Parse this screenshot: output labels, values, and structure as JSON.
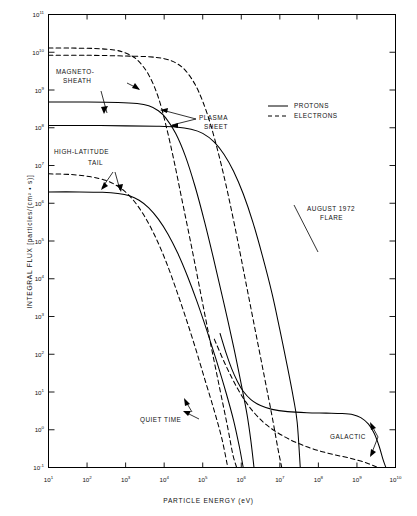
{
  "chart_data": {
    "type": "line",
    "title": "",
    "xlabel": "PARTICLE ENERGY (eV)",
    "ylabel": "INTEGRAL FLUX [particles/(cm² • s)]",
    "xlim": [
      1,
      10
    ],
    "ylim": [
      -1,
      11
    ],
    "xscale": "log",
    "yscale": "log",
    "grid": false,
    "legend_position": "top-right",
    "x_ticks": [
      "10¹",
      "10²",
      "10³",
      "10⁴",
      "10⁵",
      "10⁶",
      "10⁷",
      "10⁸",
      "10⁹",
      "10¹⁰"
    ],
    "x_tick_exponents": [
      1,
      2,
      3,
      4,
      5,
      6,
      7,
      8,
      9,
      10
    ],
    "y_ticks": [
      "10⁻¹",
      "10⁰",
      "10¹",
      "10²",
      "10³",
      "10⁴",
      "10⁵",
      "10⁶",
      "10⁷",
      "10⁸",
      "10⁹",
      "10¹⁰",
      "10¹¹"
    ],
    "y_tick_exponents": [
      -1,
      0,
      1,
      2,
      3,
      4,
      5,
      6,
      7,
      8,
      9,
      10,
      11
    ],
    "legend": [
      {
        "label": "PROTONS",
        "style": "solid"
      },
      {
        "label": "ELECTRONS",
        "style": "dashed"
      }
    ],
    "annotations": [
      {
        "text": "MAGNETO-\nSHEATH",
        "lines": [
          "MAGNETO-",
          "SHEATH"
        ]
      },
      {
        "text": "PLASMA\nSHEET",
        "lines": [
          "PLASMA",
          "SHEET"
        ]
      },
      {
        "text": "HIGH-LATITUDE\nTAIL",
        "lines": [
          "HIGH-LATITUDE",
          "TAIL"
        ]
      },
      {
        "text": "AUGUST 1972\nFLARE",
        "lines": [
          "AUGUST 1972",
          "FLARE"
        ]
      },
      {
        "text": "QUIET TIME",
        "lines": [
          "QUIET TIME"
        ]
      },
      {
        "text": "GALACTIC",
        "lines": [
          "GALACTIC"
        ]
      }
    ],
    "series": [
      {
        "name": "MAGNETOSHEATH ELECTRONS",
        "style": "dashed",
        "particle": "electrons",
        "points": [
          [
            1,
            10.11
          ],
          [
            1.6,
            10.11
          ],
          [
            2.2,
            10.1
          ],
          [
            2.7,
            10.06
          ],
          [
            3.0,
            9.98
          ],
          [
            3.3,
            9.8
          ],
          [
            3.6,
            9.4
          ],
          [
            3.85,
            8.8
          ],
          [
            4.05,
            8.05
          ],
          [
            4.25,
            7.15
          ],
          [
            4.45,
            6.15
          ],
          [
            4.7,
            4.9
          ],
          [
            4.95,
            3.6
          ],
          [
            5.2,
            2.3
          ],
          [
            5.45,
            1.05
          ],
          [
            5.65,
            0.05
          ],
          [
            5.78,
            -0.65
          ],
          [
            5.88,
            -1.0
          ]
        ]
      },
      {
        "name": "MAGNETOSHEATH PROTONS",
        "style": "solid",
        "particle": "protons",
        "points": [
          [
            1,
            8.68
          ],
          [
            2,
            8.68
          ],
          [
            2.8,
            8.67
          ],
          [
            3.3,
            8.64
          ],
          [
            3.6,
            8.58
          ],
          [
            3.85,
            8.45
          ],
          [
            4.05,
            8.25
          ],
          [
            4.3,
            7.85
          ],
          [
            4.55,
            7.25
          ],
          [
            4.8,
            6.45
          ],
          [
            5.05,
            5.5
          ],
          [
            5.3,
            4.45
          ],
          [
            5.55,
            3.35
          ],
          [
            5.8,
            2.2
          ],
          [
            6.0,
            1.2
          ],
          [
            6.15,
            0.4
          ],
          [
            6.25,
            -0.3
          ],
          [
            6.33,
            -1.0
          ]
        ]
      },
      {
        "name": "PLASMA SHEET ELECTRONS",
        "style": "dashed",
        "particle": "electrons",
        "points": [
          [
            1,
            9.92
          ],
          [
            2,
            9.92
          ],
          [
            3,
            9.9
          ],
          [
            3.6,
            9.88
          ],
          [
            4.0,
            9.83
          ],
          [
            4.3,
            9.72
          ],
          [
            4.55,
            9.52
          ],
          [
            4.8,
            9.15
          ],
          [
            5.0,
            8.7
          ],
          [
            5.2,
            8.1
          ],
          [
            5.4,
            7.35
          ],
          [
            5.6,
            6.5
          ],
          [
            5.85,
            5.3
          ],
          [
            6.1,
            4.0
          ],
          [
            6.35,
            2.7
          ],
          [
            6.6,
            1.4
          ],
          [
            6.8,
            0.35
          ],
          [
            6.95,
            -0.5
          ],
          [
            7.05,
            -1.0
          ]
        ]
      },
      {
        "name": "PLASMA SHEET PROTONS",
        "style": "solid",
        "particle": "protons",
        "points": [
          [
            1,
            8.06
          ],
          [
            2,
            8.06
          ],
          [
            3,
            8.05
          ],
          [
            3.8,
            8.04
          ],
          [
            4.3,
            8.02
          ],
          [
            4.7,
            7.96
          ],
          [
            5.0,
            7.85
          ],
          [
            5.3,
            7.62
          ],
          [
            5.55,
            7.3
          ],
          [
            5.8,
            6.85
          ],
          [
            6.05,
            6.25
          ],
          [
            6.3,
            5.5
          ],
          [
            6.55,
            4.6
          ],
          [
            6.8,
            3.6
          ],
          [
            7.0,
            2.65
          ],
          [
            7.2,
            1.65
          ],
          [
            7.35,
            0.85
          ],
          [
            7.45,
            0.2
          ],
          [
            7.53,
            -1.0
          ]
        ]
      },
      {
        "name": "HIGH-LATITUDE TAIL ELECTRONS",
        "style": "dashed",
        "particle": "electrons",
        "points": [
          [
            1,
            6.78
          ],
          [
            1.6,
            6.76
          ],
          [
            2.1,
            6.7
          ],
          [
            2.5,
            6.6
          ],
          [
            2.8,
            6.45
          ],
          [
            3.05,
            6.25
          ],
          [
            3.3,
            5.95
          ],
          [
            3.55,
            5.55
          ],
          [
            3.8,
            5.05
          ],
          [
            4.05,
            4.45
          ],
          [
            4.3,
            3.75
          ],
          [
            4.55,
            3.0
          ],
          [
            4.8,
            2.2
          ],
          [
            5.05,
            1.35
          ],
          [
            5.3,
            0.5
          ],
          [
            5.5,
            -0.25
          ],
          [
            5.65,
            -1.0
          ]
        ]
      },
      {
        "name": "HIGH-LATITUDE TAIL PROTONS",
        "style": "solid",
        "particle": "protons",
        "points": [
          [
            1,
            6.3
          ],
          [
            1.8,
            6.3
          ],
          [
            2.4,
            6.29
          ],
          [
            2.8,
            6.26
          ],
          [
            3.1,
            6.2
          ],
          [
            3.35,
            6.08
          ],
          [
            3.6,
            5.88
          ],
          [
            3.85,
            5.58
          ],
          [
            4.1,
            5.18
          ],
          [
            4.35,
            4.68
          ],
          [
            4.6,
            4.08
          ],
          [
            4.85,
            3.4
          ],
          [
            5.1,
            2.65
          ],
          [
            5.35,
            1.85
          ],
          [
            5.6,
            1.0
          ],
          [
            5.8,
            0.25
          ],
          [
            5.95,
            -0.45
          ],
          [
            6.05,
            -1.0
          ]
        ]
      },
      {
        "name": "QUIET TIME / GALACTIC PROTONS",
        "style": "solid",
        "particle": "protons",
        "points": [
          [
            5.45,
            2.55
          ],
          [
            5.6,
            2.05
          ],
          [
            5.75,
            1.62
          ],
          [
            5.9,
            1.28
          ],
          [
            6.05,
            1.02
          ],
          [
            6.25,
            0.8
          ],
          [
            6.5,
            0.64
          ],
          [
            6.8,
            0.54
          ],
          [
            7.2,
            0.48
          ],
          [
            7.7,
            0.45
          ],
          [
            8.2,
            0.44
          ],
          [
            8.6,
            0.43
          ],
          [
            8.9,
            0.4
          ],
          [
            9.1,
            0.32
          ],
          [
            9.3,
            0.15
          ],
          [
            9.45,
            -0.1
          ],
          [
            9.58,
            -0.45
          ],
          [
            9.68,
            -0.8
          ],
          [
            9.75,
            -1.0
          ]
        ]
      },
      {
        "name": "QUIET TIME / GALACTIC ELECTRONS",
        "style": "dashed",
        "particle": "electrons",
        "points": [
          [
            5.3,
            2.4
          ],
          [
            5.6,
            1.7
          ],
          [
            5.9,
            1.1
          ],
          [
            6.2,
            0.62
          ],
          [
            6.55,
            0.22
          ],
          [
            6.9,
            -0.05
          ],
          [
            7.3,
            -0.28
          ],
          [
            7.7,
            -0.45
          ],
          [
            8.1,
            -0.58
          ],
          [
            8.5,
            -0.68
          ],
          [
            8.85,
            -0.76
          ],
          [
            9.1,
            -0.83
          ],
          [
            9.3,
            -0.9
          ],
          [
            9.45,
            -0.96
          ],
          [
            9.55,
            -1.0
          ]
        ]
      }
    ]
  },
  "axes": {
    "x_title": "PARTICLE ENERGY (eV)",
    "y_title": "INTEGRAL FLUX [particles/(cm² • s)]"
  },
  "legend": {
    "protons": "PROTONS",
    "electrons": "ELECTRONS"
  },
  "annotations": {
    "magnetosheath_1": "MAGNETO-",
    "magnetosheath_2": "SHEATH",
    "plasma_sheet_1": "PLASMA",
    "plasma_sheet_2": "SHEET",
    "high_lat_tail_1": "HIGH-LATITUDE",
    "high_lat_tail_2": "TAIL",
    "flare_1": "AUGUST 1972",
    "flare_2": "FLARE",
    "quiet_time": "QUIET TIME",
    "galactic": "GALACTIC"
  }
}
